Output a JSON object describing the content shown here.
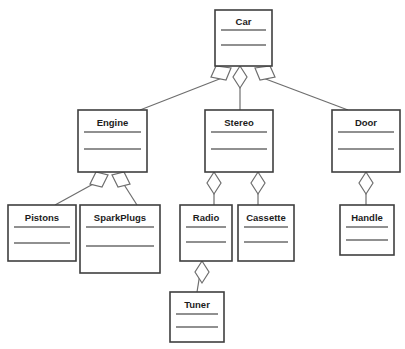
{
  "diagram": {
    "caption": "",
    "background_color": "#ffffff",
    "box_stroke_color": "#3f3f3f",
    "divider_color": "#6b6b6b",
    "link_color": "#6e6e6e",
    "label_color": "#1c1c1c",
    "classes": [
      {
        "id": "car",
        "label": "Car",
        "x": 215,
        "y": 10,
        "w": 57,
        "h": 56
      },
      {
        "id": "engine",
        "label": "Engine",
        "x": 78,
        "y": 110,
        "w": 69,
        "h": 62
      },
      {
        "id": "stereo",
        "label": "Stereo",
        "x": 205,
        "y": 110,
        "w": 68,
        "h": 62
      },
      {
        "id": "door",
        "label": "Door",
        "x": 332,
        "y": 110,
        "w": 68,
        "h": 62
      },
      {
        "id": "pistons",
        "label": "Pistons",
        "x": 8,
        "y": 205,
        "w": 68,
        "h": 56
      },
      {
        "id": "sparkplugs",
        "label": "SparkPlugs",
        "x": 80,
        "y": 205,
        "w": 80,
        "h": 68
      },
      {
        "id": "radio",
        "label": "Radio",
        "x": 180,
        "y": 205,
        "w": 52,
        "h": 56
      },
      {
        "id": "cassette",
        "label": "Cassette",
        "x": 238,
        "y": 205,
        "w": 56,
        "h": 56
      },
      {
        "id": "handle",
        "label": "Handle",
        "x": 340,
        "y": 205,
        "w": 54,
        "h": 50
      },
      {
        "id": "tuner",
        "label": "Tuner",
        "x": 170,
        "y": 292,
        "w": 54,
        "h": 50
      }
    ],
    "relationships": [
      {
        "id": "car-engine",
        "from": "Car",
        "to": "Engine",
        "type": "aggregation"
      },
      {
        "id": "car-stereo",
        "from": "Car",
        "to": "Stereo",
        "type": "aggregation"
      },
      {
        "id": "car-door",
        "from": "Car",
        "to": "Door",
        "type": "aggregation"
      },
      {
        "id": "engine-pistons",
        "from": "Engine",
        "to": "Pistons",
        "type": "aggregation"
      },
      {
        "id": "engine-sparkplugs",
        "from": "Engine",
        "to": "SparkPlugs",
        "type": "aggregation"
      },
      {
        "id": "stereo-radio",
        "from": "Stereo",
        "to": "Radio",
        "type": "aggregation"
      },
      {
        "id": "stereo-cassette",
        "from": "Stereo",
        "to": "Cassette",
        "type": "aggregation"
      },
      {
        "id": "door-handle",
        "from": "Door",
        "to": "Handle",
        "type": "aggregation"
      },
      {
        "id": "radio-tuner",
        "from": "Radio",
        "to": "Tuner",
        "type": "aggregation"
      }
    ]
  }
}
